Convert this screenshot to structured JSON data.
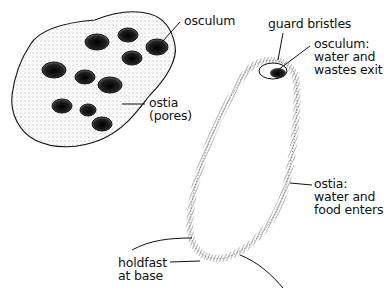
{
  "diagram": {
    "colony": {
      "labels": {
        "osculum": "osculum",
        "ostia_line1": "ostia",
        "ostia_line2": "(pores)"
      }
    },
    "single_sponge": {
      "labels": {
        "guard_bristles": "guard bristles",
        "osculum_line1": "osculum:",
        "osculum_line2": "water and",
        "osculum_line3": "wastes exit",
        "ostia_line1": "ostia:",
        "ostia_line2": "water and",
        "ostia_line3": "food enters",
        "holdfast_line1": "holdfast",
        "holdfast_line2": "at base"
      }
    },
    "colors": {
      "ink": "#111111",
      "background": "#ffffff"
    }
  }
}
